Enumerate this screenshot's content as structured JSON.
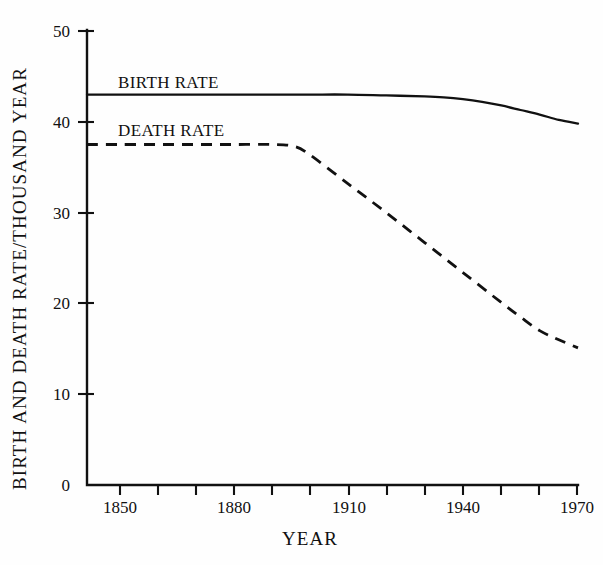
{
  "chart_data": {
    "type": "line",
    "title": "",
    "xlabel": "YEAR",
    "ylabel": "BIRTH AND DEATH RATE/THOUSAND YEAR",
    "xlim": [
      1842,
      1970
    ],
    "ylim": [
      0,
      50
    ],
    "grid": false,
    "legend_position": "inline-on-curves",
    "x_ticks": [
      1850,
      1880,
      1910,
      1940,
      1970
    ],
    "x_tick_labels": [
      "1850",
      "1880",
      "1910",
      "1940",
      "1970"
    ],
    "x_minor_ticks": [
      1850,
      1860,
      1870,
      1880,
      1890,
      1900,
      1910,
      1920,
      1930,
      1940,
      1950,
      1960,
      1970
    ],
    "y_ticks": [
      0,
      10,
      20,
      30,
      40,
      50
    ],
    "y_tick_labels": [
      "0",
      "10",
      "20",
      "30",
      "40",
      "50"
    ],
    "series": [
      {
        "name": "BIRTH RATE",
        "style": "solid",
        "x": [
          1842,
          1850,
          1860,
          1870,
          1880,
          1890,
          1900,
          1910,
          1920,
          1930,
          1935,
          1940,
          1945,
          1950,
          1955,
          1960,
          1965,
          1970
        ],
        "values": [
          43.0,
          43.0,
          43.0,
          43.0,
          43.0,
          43.0,
          43.0,
          43.0,
          42.9,
          42.8,
          42.7,
          42.5,
          42.2,
          41.8,
          41.3,
          40.8,
          40.2,
          39.8
        ]
      },
      {
        "name": "DEATH RATE",
        "style": "dashed",
        "x": [
          1842,
          1850,
          1860,
          1870,
          1880,
          1890,
          1896,
          1900,
          1910,
          1920,
          1930,
          1940,
          1950,
          1955,
          1960,
          1965,
          1970
        ],
        "values": [
          37.5,
          37.5,
          37.5,
          37.5,
          37.5,
          37.5,
          37.3,
          36.4,
          33.2,
          30.0,
          26.7,
          23.4,
          20.1,
          18.5,
          17.0,
          16.0,
          15.1
        ]
      }
    ]
  }
}
